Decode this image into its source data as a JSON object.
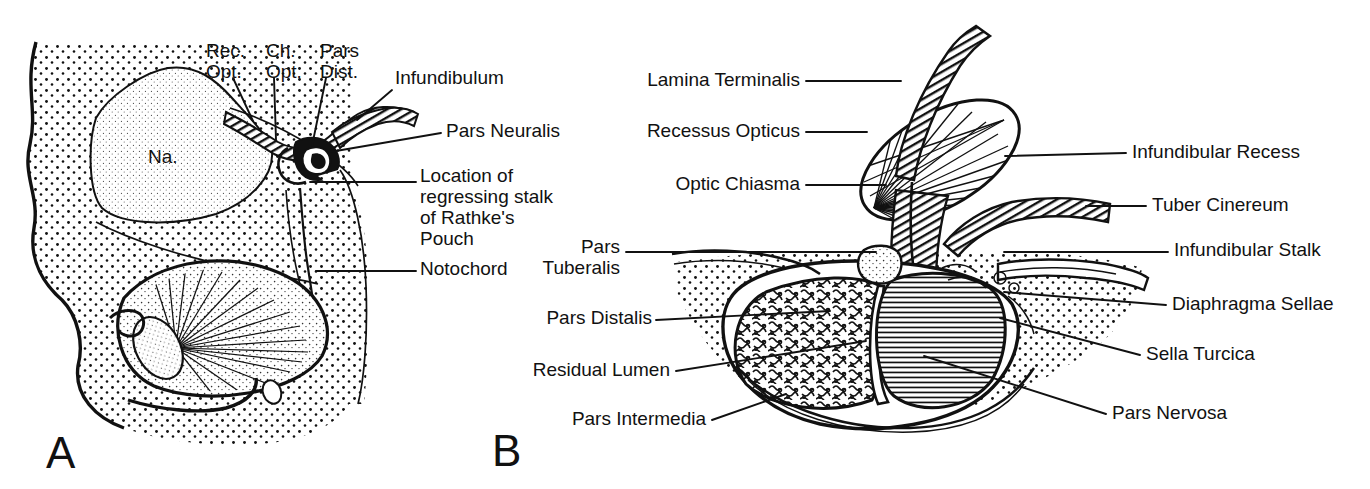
{
  "figure": {
    "background_color": "#ffffff",
    "ink_color": "#111111",
    "width": 1370,
    "height": 489
  },
  "panels": [
    {
      "letter": "A",
      "letter_pos": {
        "x": 46,
        "y": 468
      },
      "caption": "Early embryonic sagittal section through the developing head",
      "internal_labels": [
        {
          "name": "na-label",
          "text": "Na.",
          "x": 148,
          "y": 163
        }
      ],
      "labels": [
        {
          "name": "rec-opt",
          "lines": [
            "Rec.",
            "Opt."
          ],
          "x": 206,
          "y": 57,
          "align": "start",
          "leader": "M233,78 L253,121"
        },
        {
          "name": "ch-opt",
          "lines": [
            "Ch.",
            "Opt."
          ],
          "x": 266,
          "y": 57,
          "align": "start",
          "leader": "M274,78 L276,140"
        },
        {
          "name": "pars-dist",
          "lines": [
            "Pars",
            "Dist."
          ],
          "x": 320,
          "y": 57,
          "align": "start",
          "leader": "M326,78 L312,146"
        },
        {
          "name": "infundibulum",
          "lines": [
            "Infundibulum"
          ],
          "x": 395,
          "y": 84,
          "align": "start",
          "leader": "M392,90 L357,120"
        },
        {
          "name": "pars-neuralis",
          "lines": [
            "Pars Neuralis"
          ],
          "x": 446,
          "y": 137,
          "align": "start",
          "leader": "M441,133 L330,152"
        },
        {
          "name": "location-regressing-stalk",
          "lines": [
            "Location of",
            "regressing stalk",
            "of Rathke's",
            "Pouch"
          ],
          "x": 420,
          "y": 182,
          "align": "start",
          "leader": "M416,182 L310,182"
        },
        {
          "name": "notochord",
          "lines": [
            "Notochord"
          ],
          "x": 420,
          "y": 275,
          "align": "start",
          "leader": "M416,271 L316,271"
        }
      ]
    },
    {
      "letter": "B",
      "letter_pos": {
        "x": 492,
        "y": 466
      },
      "caption": "Mature pituitary gland in the sella turcica",
      "internal_labels": [],
      "labels": [
        {
          "name": "lamina-terminalis",
          "lines": [
            "Lamina Terminalis"
          ],
          "x": 800,
          "y": 86,
          "align": "end",
          "leader": "M806,81 L901,81"
        },
        {
          "name": "recessus-opticus",
          "lines": [
            "Recessus Opticus"
          ],
          "x": 800,
          "y": 137,
          "align": "end",
          "leader": "M806,132 L867,132"
        },
        {
          "name": "optic-chiasma",
          "lines": [
            "Optic Chiasma"
          ],
          "x": 800,
          "y": 190,
          "align": "end",
          "leader": "M806,185 L886,185"
        },
        {
          "name": "pars-tuberalis",
          "lines": [
            "Pars",
            "Tuberalis"
          ],
          "x": 620,
          "y": 253,
          "align": "end",
          "leader": "M626,252 L876,252"
        },
        {
          "name": "pars-distalis",
          "lines": [
            "Pars Distalis"
          ],
          "x": 652,
          "y": 324,
          "align": "end",
          "leader": "M656,320 L830,311"
        },
        {
          "name": "residual-lumen",
          "lines": [
            "Residual Lumen"
          ],
          "x": 670,
          "y": 376,
          "align": "end",
          "leader": "M676,371 L866,341"
        },
        {
          "name": "pars-intermedia",
          "lines": [
            "Pars Intermedia"
          ],
          "x": 706,
          "y": 425,
          "align": "end",
          "leader": "M712,420 L786,394"
        },
        {
          "name": "infundibular-recess",
          "lines": [
            "Infundibular Recess"
          ],
          "x": 1132,
          "y": 158,
          "align": "start",
          "leader": "M1126,153 L1005,156"
        },
        {
          "name": "tuber-cinereum",
          "lines": [
            "Tuber Cinereum"
          ],
          "x": 1152,
          "y": 211,
          "align": "start",
          "leader": "M1146,206 L1086,206"
        },
        {
          "name": "infundibular-stalk",
          "lines": [
            "Infundibular Stalk"
          ],
          "x": 1174,
          "y": 256,
          "align": "start",
          "leader": "M1168,252 L1004,252"
        },
        {
          "name": "diaphragma-sellae",
          "lines": [
            "Diaphragma Sellae"
          ],
          "x": 1172,
          "y": 310,
          "align": "start",
          "leader": "M1166,305 L1004,292"
        },
        {
          "name": "sella-turcica",
          "lines": [
            "Sella Turcica"
          ],
          "x": 1146,
          "y": 360,
          "align": "start",
          "leader": "M1140,355 L1000,318"
        },
        {
          "name": "pars-nervosa",
          "lines": [
            "Pars Nervosa"
          ],
          "x": 1112,
          "y": 419,
          "align": "start",
          "leader": "M1106,414 L924,356"
        }
      ]
    }
  ],
  "typography": {
    "label_font_size": 19,
    "label_line_height": 21,
    "panel_letter_font_size": 44,
    "na_font_size": 19
  }
}
